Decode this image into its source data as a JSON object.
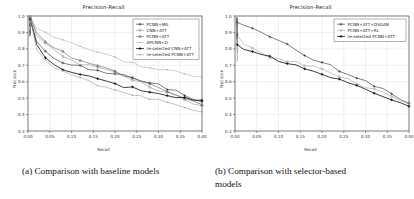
{
  "figure": {
    "caption_a": "(a) Comparison with baseline models",
    "caption_b_line1": "(b)  Comparison   with   selector-based",
    "caption_b_line2": "models"
  },
  "chart_data": [
    {
      "type": "line",
      "panel": "a",
      "title": "Precision-Recall",
      "xlabel": "Recall",
      "ylabel": "Precision",
      "xlim": [
        0.0,
        0.4
      ],
      "ylim": [
        0.3,
        1.0
      ],
      "xticks": [
        "0.00",
        "0.05",
        "0.10",
        "0.15",
        "0.20",
        "0.25",
        "0.30",
        "0.35",
        "0.40"
      ],
      "yticks": [
        "0.3",
        "0.4",
        "0.5",
        "0.6",
        "0.7",
        "0.8",
        "0.9",
        "1.0"
      ],
      "grid": true,
      "legend_position": "upper right",
      "x": [
        0.005,
        0.02,
        0.04,
        0.06,
        0.08,
        0.1,
        0.12,
        0.14,
        0.16,
        0.18,
        0.2,
        0.22,
        0.24,
        0.26,
        0.28,
        0.3,
        0.32,
        0.34,
        0.36,
        0.38,
        0.4
      ],
      "series": [
        {
          "name": "PCNN+MIL",
          "color": "#1a1a1a",
          "marker": "plus",
          "values": [
            0.99,
            0.85,
            0.78,
            0.74,
            0.72,
            0.7,
            0.7,
            0.68,
            0.67,
            0.66,
            0.65,
            0.64,
            0.63,
            0.61,
            0.6,
            0.58,
            0.56,
            0.54,
            0.52,
            0.5,
            0.48
          ]
        },
        {
          "name": "CNN+ATT",
          "color": "#8c8c8c",
          "marker": "circle",
          "values": [
            0.99,
            0.88,
            0.83,
            0.79,
            0.76,
            0.73,
            0.71,
            0.7,
            0.69,
            0.67,
            0.65,
            0.63,
            0.61,
            0.59,
            0.57,
            0.55,
            0.53,
            0.51,
            0.49,
            0.47,
            0.45
          ]
        },
        {
          "name": "PCNN+ATT",
          "color": "#555555",
          "marker": "triangle",
          "values": [
            0.99,
            0.9,
            0.85,
            0.81,
            0.78,
            0.75,
            0.73,
            0.71,
            0.7,
            0.68,
            0.66,
            0.64,
            0.62,
            0.6,
            0.58,
            0.56,
            0.54,
            0.52,
            0.5,
            0.48,
            0.46
          ]
        },
        {
          "name": "APCNN+D",
          "color": "#aaaaaa",
          "marker": "dot",
          "values": [
            0.99,
            0.93,
            0.9,
            0.87,
            0.85,
            0.83,
            0.81,
            0.79,
            0.78,
            0.76,
            0.75,
            0.73,
            0.72,
            0.7,
            0.69,
            0.68,
            0.67,
            0.66,
            0.65,
            0.64,
            0.63
          ]
        },
        {
          "name": "re-selected CNN+ATT",
          "color": "#000000",
          "marker": "plus-bold",
          "values": [
            0.99,
            0.82,
            0.74,
            0.7,
            0.68,
            0.66,
            0.64,
            0.63,
            0.61,
            0.6,
            0.58,
            0.57,
            0.56,
            0.55,
            0.54,
            0.53,
            0.52,
            0.51,
            0.5,
            0.49,
            0.48
          ]
        },
        {
          "name": "re-selected PCNN+ATT",
          "color": "#999999",
          "marker": "small-dot",
          "values": [
            0.99,
            0.8,
            0.73,
            0.69,
            0.66,
            0.64,
            0.62,
            0.6,
            0.58,
            0.56,
            0.55,
            0.53,
            0.52,
            0.51,
            0.5,
            0.49,
            0.48,
            0.46,
            0.45,
            0.43,
            0.42
          ]
        }
      ]
    },
    {
      "type": "line",
      "panel": "b",
      "title": "Precision-Recall",
      "xlabel": "Recall",
      "ylabel": "Precision",
      "xlim": [
        0.0,
        0.4
      ],
      "ylim": [
        0.3,
        1.0
      ],
      "xticks": [
        "0.00",
        "0.05",
        "0.10",
        "0.15",
        "0.20",
        "0.25",
        "0.30",
        "0.35",
        "0.40"
      ],
      "yticks": [
        "0.3",
        "0.4",
        "0.5",
        "0.6",
        "0.7",
        "0.8",
        "0.9",
        "1.0"
      ],
      "grid": true,
      "legend_position": "upper right",
      "x": [
        0.005,
        0.02,
        0.04,
        0.06,
        0.08,
        0.1,
        0.12,
        0.14,
        0.16,
        0.18,
        0.2,
        0.22,
        0.24,
        0.26,
        0.28,
        0.3,
        0.32,
        0.34,
        0.36,
        0.38,
        0.4
      ],
      "series": [
        {
          "name": "PCNN+ATT+DSGAN",
          "color": "#1a1a1a",
          "marker": "plus",
          "values": [
            0.97,
            0.95,
            0.92,
            0.9,
            0.88,
            0.85,
            0.83,
            0.8,
            0.76,
            0.74,
            0.72,
            0.7,
            0.67,
            0.65,
            0.63,
            0.6,
            0.58,
            0.55,
            0.53,
            0.5,
            0.47
          ]
        },
        {
          "name": "PCNN+ATT+RL",
          "color": "#9a9a9a",
          "marker": "circle",
          "values": [
            0.88,
            0.83,
            0.8,
            0.77,
            0.75,
            0.74,
            0.73,
            0.72,
            0.7,
            0.69,
            0.67,
            0.65,
            0.63,
            0.61,
            0.59,
            0.57,
            0.55,
            0.53,
            0.51,
            0.49,
            0.46
          ]
        },
        {
          "name": "re-selected PCNN+ATT",
          "color": "#000000",
          "marker": "plus-bold",
          "values": [
            0.82,
            0.8,
            0.79,
            0.77,
            0.75,
            0.73,
            0.71,
            0.7,
            0.68,
            0.66,
            0.64,
            0.63,
            0.61,
            0.59,
            0.57,
            0.55,
            0.53,
            0.51,
            0.49,
            0.47,
            0.45
          ]
        }
      ]
    }
  ]
}
